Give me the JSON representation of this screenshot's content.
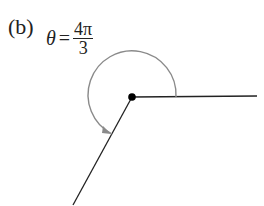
{
  "figure": {
    "part_label": "(b)",
    "theta_symbol": "θ",
    "equals": "=",
    "numerator": "4π",
    "denominator": "3",
    "angle_radians": "4π/3"
  },
  "colors": {
    "rays": "#222222",
    "arc": "#8a8a8a",
    "vertex": "#000000"
  }
}
